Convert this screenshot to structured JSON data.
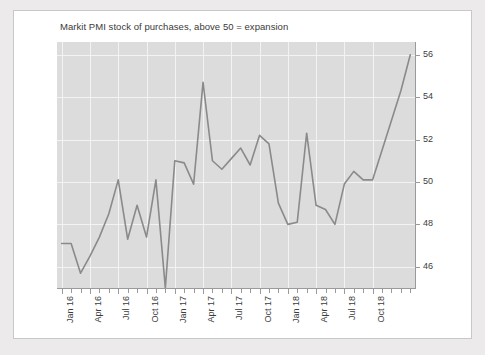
{
  "chart_data": {
    "type": "line",
    "title": "Markit PMI stock of purchases, above 50 = expansion",
    "xlabel": "",
    "ylabel": "",
    "ylim": [
      45,
      56.6
    ],
    "yticks": [
      46,
      48,
      50,
      52,
      54,
      56
    ],
    "ytick_labels": [
      "46",
      "48",
      "50",
      "52",
      "54",
      "56"
    ],
    "y_axis_position": "right",
    "grid": true,
    "legend": "none",
    "panel_color": "#dcdcdc",
    "grid_color": "#f3f3f3",
    "line_color": "#8a8a8a",
    "x_tick_labels": [
      "Jan 16",
      "Apr 16",
      "Jul 16",
      "Oct 16",
      "Jan 17",
      "Apr 17",
      "Jul 17",
      "Oct 17",
      "Jan 18",
      "Apr 18",
      "Jul 18",
      "Oct 18"
    ],
    "x": [
      "Jan 16",
      "Feb 16",
      "Mar 16",
      "Apr 16",
      "May 16",
      "Jun 16",
      "Jul 16",
      "Aug 16",
      "Sep 16",
      "Oct 16",
      "Nov 16",
      "Dec 16",
      "Jan 17",
      "Feb 17",
      "Mar 17",
      "Apr 17",
      "May 17",
      "Jun 17",
      "Jul 17",
      "Aug 17",
      "Sep 17",
      "Oct 17",
      "Nov 17",
      "Dec 17",
      "Jan 18",
      "Feb 18",
      "Mar 18",
      "Apr 18",
      "May 18",
      "Jun 18",
      "Jul 18",
      "Aug 18",
      "Sep 18",
      "Oct 18",
      "Nov 18",
      "Dec 18",
      "Jan 19",
      "Feb 19"
    ],
    "values": [
      47.1,
      47.1,
      45.7,
      46.5,
      47.4,
      48.5,
      50.1,
      47.3,
      48.9,
      47.4,
      50.1,
      45.0,
      51.0,
      50.9,
      49.9,
      54.7,
      51.0,
      50.6,
      51.1,
      51.6,
      50.8,
      52.2,
      51.8,
      49.0,
      48.0,
      48.1,
      52.3,
      48.9,
      48.7,
      48.0,
      49.9,
      50.5,
      50.1,
      50.1,
      51.5,
      52.9,
      54.3,
      56.0
    ],
    "series_name": "Markit PMI stock of purchases",
    "reference_value": 50
  }
}
